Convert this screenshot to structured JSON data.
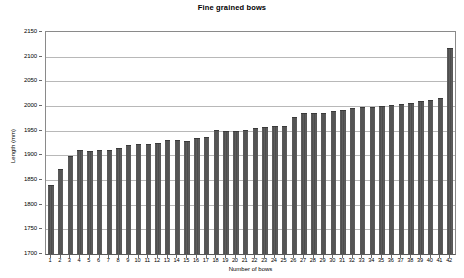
{
  "chart_data": {
    "type": "bar",
    "title": "Fine grained bows",
    "xlabel": "Number of bows",
    "ylabel": "Length (mm)",
    "ylim": [
      1700,
      2150
    ],
    "ytick_step": 50,
    "yticks": [
      1700,
      1750,
      1800,
      1850,
      1900,
      1950,
      2000,
      2050,
      2100,
      2150
    ],
    "grid": true,
    "legend": "none",
    "bar_color": "#4f4f4f",
    "categories": [
      "1",
      "2",
      "3",
      "4",
      "5",
      "6",
      "7",
      "8",
      "9",
      "10",
      "11",
      "12",
      "13",
      "14",
      "15",
      "16",
      "17",
      "18",
      "19",
      "20",
      "21",
      "22",
      "23",
      "24",
      "25",
      "26",
      "27",
      "28",
      "29",
      "30",
      "31",
      "32",
      "33",
      "34",
      "35",
      "36",
      "37",
      "38",
      "39",
      "40",
      "41",
      "42"
    ],
    "values": [
      1840,
      1873,
      1898,
      1910,
      1908,
      1911,
      1911,
      1914,
      1921,
      1923,
      1923,
      1926,
      1932,
      1932,
      1930,
      1935,
      1937,
      1951,
      1950,
      1950,
      1952,
      1956,
      1958,
      1959,
      1959,
      1977,
      1985,
      1985,
      1985,
      1990,
      1991,
      1996,
      1998,
      1999,
      2001,
      2003,
      2005,
      2007,
      2010,
      2012,
      2016,
      2118
    ]
  }
}
